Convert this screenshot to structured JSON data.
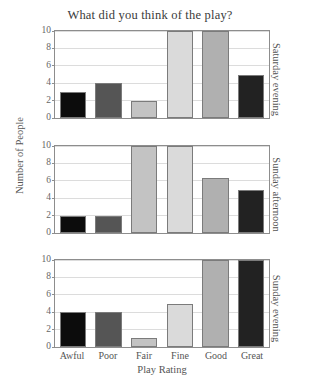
{
  "chart_data": {
    "type": "bar",
    "title": "What did you think of the play?",
    "xlabel": "Play Rating",
    "ylabel": "Number of People",
    "categories": [
      "Awful",
      "Poor",
      "Fair",
      "Fine",
      "Good",
      "Great"
    ],
    "ylim": [
      0,
      10
    ],
    "yticks": [
      0,
      2,
      4,
      6,
      8,
      10
    ],
    "grid": true,
    "legend": "none",
    "layout": "three stacked panels sharing x-axis, panel names on right edge rotated 90 degrees",
    "panels": [
      {
        "name": "Saturday evening",
        "values": [
          3,
          4,
          2,
          10,
          10,
          5
        ]
      },
      {
        "name": "Sunday afternoon",
        "values": [
          2,
          2,
          10,
          10,
          6.3,
          5
        ]
      },
      {
        "name": "Sunday evening",
        "values": [
          4,
          4,
          1,
          4.9,
          10,
          10
        ]
      }
    ],
    "bar_colors": [
      "#0c0c0c",
      "#555555",
      "#c3c3c3",
      "#dadada",
      "#b0b0b0",
      "#222222"
    ],
    "bar_edge_color": "#7b7b7b",
    "grid_color": "#dcdcdc",
    "axis_color": "#8d8d8d",
    "text_color": "#555555"
  }
}
